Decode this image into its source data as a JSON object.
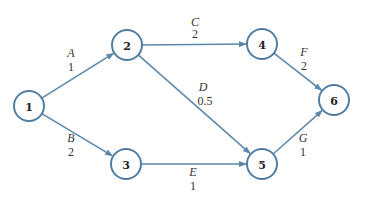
{
  "diagram": {
    "type": "activity-network",
    "colors": {
      "node_stroke": "#4f7ea3",
      "edge": "#5b87aa",
      "text": "#333333"
    },
    "nodes": [
      {
        "id": "1",
        "label": "1",
        "x": 29,
        "y": 106
      },
      {
        "id": "2",
        "label": "2",
        "x": 127,
        "y": 45
      },
      {
        "id": "3",
        "label": "3",
        "x": 126,
        "y": 164
      },
      {
        "id": "4",
        "label": "4",
        "x": 262,
        "y": 44
      },
      {
        "id": "5",
        "label": "5",
        "x": 262,
        "y": 164
      },
      {
        "id": "6",
        "label": "6",
        "x": 334,
        "y": 100
      }
    ],
    "edges": [
      {
        "from": "1",
        "to": "2",
        "name": "A",
        "weight": "1",
        "name_x": 71,
        "name_y": 57,
        "weight_x": 71,
        "weight_y": 71
      },
      {
        "from": "1",
        "to": "3",
        "name": "B",
        "weight": "2",
        "name_x": 71,
        "name_y": 142,
        "weight_x": 71,
        "weight_y": 156
      },
      {
        "from": "2",
        "to": "4",
        "name": "C",
        "weight": "2",
        "name_x": 195,
        "name_y": 26,
        "weight_x": 195,
        "weight_y": 38
      },
      {
        "from": "2",
        "to": "5",
        "name": "D",
        "weight": "0.5",
        "name_x": 203,
        "name_y": 91,
        "weight_x": 205,
        "weight_y": 105
      },
      {
        "from": "3",
        "to": "5",
        "name": "E",
        "weight": "1",
        "name_x": 193,
        "name_y": 176,
        "weight_x": 193,
        "weight_y": 190
      },
      {
        "from": "4",
        "to": "6",
        "name": "F",
        "weight": "2",
        "name_x": 304,
        "name_y": 56,
        "weight_x": 304,
        "weight_y": 70
      },
      {
        "from": "5",
        "to": "6",
        "name": "G",
        "weight": "1",
        "name_x": 303,
        "name_y": 142,
        "weight_x": 303,
        "weight_y": 156
      }
    ]
  }
}
